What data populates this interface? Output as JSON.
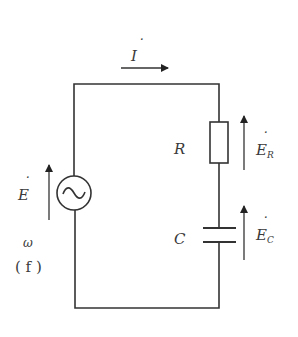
{
  "diagram": {
    "type": "RC series AC circuit",
    "colors": {
      "wire": "#333333",
      "text": "#3a3a3a",
      "background": "#ffffff"
    },
    "current": {
      "symbol": "I",
      "dot": "˙",
      "direction": "right"
    },
    "source": {
      "symbol": "E",
      "dot": "˙",
      "glyph": "~",
      "angular_frequency": "ω",
      "frequency": "( f )"
    },
    "resistor": {
      "label": "R",
      "voltage": {
        "symbol": "E",
        "subscript": "R",
        "dot": "˙"
      }
    },
    "capacitor": {
      "label": "C",
      "voltage": {
        "symbol": "E",
        "subscript": "C",
        "dot": "˙"
      }
    }
  }
}
